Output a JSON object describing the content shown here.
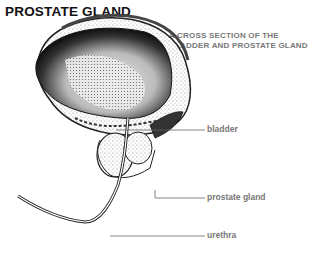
{
  "title": "PROSTATE GLAND",
  "subtitle": {
    "line1": "A CROSS SECTION OF THE",
    "line2": "BLADDER AND PROSTATE GLAND"
  },
  "labels": {
    "bladder": "bladder",
    "prostate": "prostate gland",
    "urethra": "urethra"
  }
}
